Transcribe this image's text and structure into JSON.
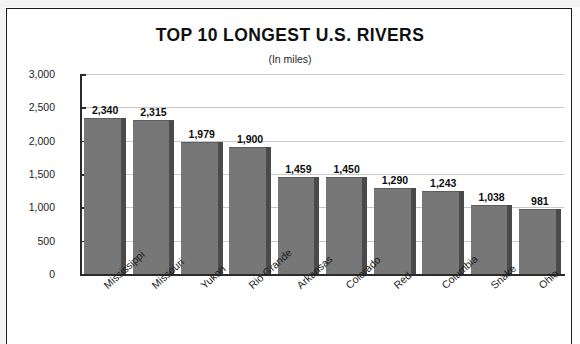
{
  "chart_data": {
    "type": "bar",
    "title": "TOP 10 LONGEST U.S. RIVERS",
    "subtitle": "(In miles)",
    "xlabel": "",
    "ylabel": "Length in miles",
    "ylim": [
      0,
      3000
    ],
    "ytick_labels": [
      "3,000",
      "2,500",
      "2,000",
      "1,500",
      "1,000",
      "500",
      "0"
    ],
    "ytick_values": [
      3000,
      2500,
      2000,
      1500,
      1000,
      500,
      0
    ],
    "grid": true,
    "legend": false,
    "bar_color": "#777777",
    "bar_side_color": "#4a4a4a",
    "categories": [
      "Mississippi",
      "Missouri",
      "Yukon",
      "Rio Grande",
      "Arkansas",
      "Colorado",
      "Red",
      "Columbia",
      "Snake",
      "Ohio"
    ],
    "values": [
      2340,
      2315,
      1979,
      1900,
      1459,
      1450,
      1290,
      1243,
      1038,
      981
    ],
    "value_labels": [
      "2,340",
      "2,315",
      "1,979",
      "1,900",
      "1,459",
      "1,450",
      "1,290",
      "1,243",
      "1,038",
      "981"
    ]
  }
}
